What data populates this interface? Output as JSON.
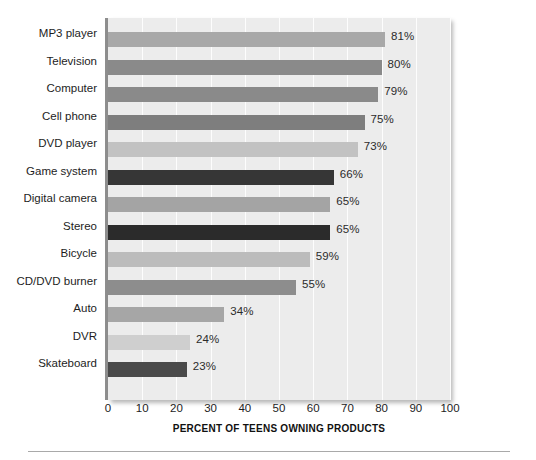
{
  "chart_data": {
    "type": "bar",
    "orientation": "horizontal",
    "title": "",
    "xlabel": "PERCENT OF TEENS OWNING PRODUCTS",
    "ylabel": "",
    "xlim": [
      0,
      105
    ],
    "xticks": [
      0,
      10,
      20,
      30,
      40,
      50,
      60,
      70,
      80,
      90,
      100
    ],
    "grid": true,
    "legend": "none",
    "plot_background": "#ececec",
    "categories": [
      "MP3 player",
      "Television",
      "Computer",
      "Cell phone",
      "DVD player",
      "Game system",
      "Digital camera",
      "Stereo",
      "Bicycle",
      "CD/DVD burner",
      "Auto",
      "DVR",
      "Skateboard"
    ],
    "values": [
      81,
      80,
      79,
      75,
      73,
      66,
      65,
      65,
      59,
      55,
      34,
      24,
      23
    ],
    "value_labels": [
      "81%",
      "80%",
      "79%",
      "75%",
      "73%",
      "66%",
      "65%",
      "65%",
      "59%",
      "55%",
      "34%",
      "24%",
      "23%"
    ],
    "bar_colors": [
      "#a8a8a8",
      "#8a8a8a",
      "#8a8a8a",
      "#7e7e7e",
      "#c2c2c2",
      "#363636",
      "#a4a4a4",
      "#2b2b2b",
      "#bcbcbc",
      "#8d8d8d",
      "#a6a6a6",
      "#cfcfcf",
      "#4a4a4a"
    ]
  }
}
